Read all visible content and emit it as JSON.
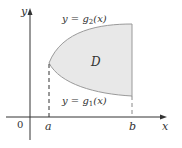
{
  "diagram": {
    "colors": {
      "axis": "#333333",
      "region_fill": "#e8e8e8",
      "region_stroke": "#9a9a9a",
      "text": "#333333"
    },
    "axes": {
      "x_label": "x",
      "y_label": "y",
      "origin_label": "0"
    },
    "ticks": {
      "a_label": "a",
      "b_label": "b"
    },
    "region": {
      "label": "D"
    },
    "curves": {
      "upper": {
        "prefix": "y = g",
        "subscript": "2",
        "suffix": "(x)"
      },
      "lower": {
        "prefix": "y = g",
        "subscript": "1",
        "suffix": "(x)"
      }
    }
  }
}
